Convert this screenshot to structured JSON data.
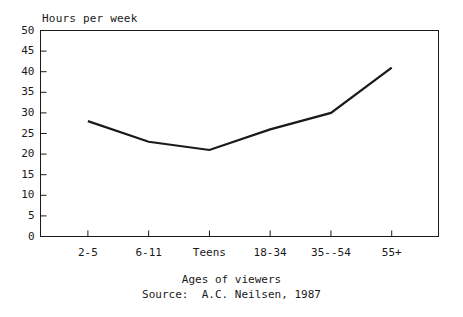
{
  "chart_data": {
    "type": "line",
    "title": "",
    "ylabel": "Hours per week",
    "xlabel": "Ages of viewers",
    "source": "Source:  A.C. Neilsen, 1987",
    "categories": [
      "2-5",
      "6-11",
      "Teens",
      "18-34",
      "35--54",
      "55+"
    ],
    "values": [
      28,
      23,
      21,
      26,
      30,
      41
    ],
    "ylim": [
      0,
      50
    ],
    "y_ticks": [
      0,
      5,
      10,
      15,
      20,
      25,
      30,
      35,
      40,
      45,
      50
    ],
    "y_tick_labels": [
      "0",
      "5",
      "10",
      "15",
      "20",
      "25",
      "30",
      "35",
      "40",
      "45",
      "50"
    ],
    "grid": false,
    "legend": "none",
    "line_color": "#1a1a1a",
    "frame_color": "#1a1a1a",
    "background": "#ffffff"
  },
  "figure": {
    "y_axis_title": "Hours per week",
    "x_axis_title": "Ages of viewers",
    "source_line": "Source:  A.C. Neilsen, 1987"
  }
}
